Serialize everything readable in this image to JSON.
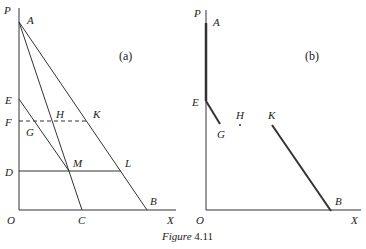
{
  "caption": {
    "prefix": "Figure",
    "number": "4.11"
  },
  "panel_a": {
    "tag": "(a)",
    "labels": {
      "P": "P",
      "A": "A",
      "E": "E",
      "F": "F",
      "G": "G",
      "H": "H",
      "K": "K",
      "D": "D",
      "M": "M",
      "L": "L",
      "O": "O",
      "C": "C",
      "B": "B",
      "X": "X"
    }
  },
  "panel_b": {
    "tag": "(b)",
    "labels": {
      "P": "P",
      "A": "A",
      "E": "E",
      "G": "G",
      "H": "H",
      "K": "K",
      "O": "O",
      "B": "B",
      "X": "X"
    }
  },
  "colors": {
    "line": "#333333",
    "background": "#ffffff"
  }
}
